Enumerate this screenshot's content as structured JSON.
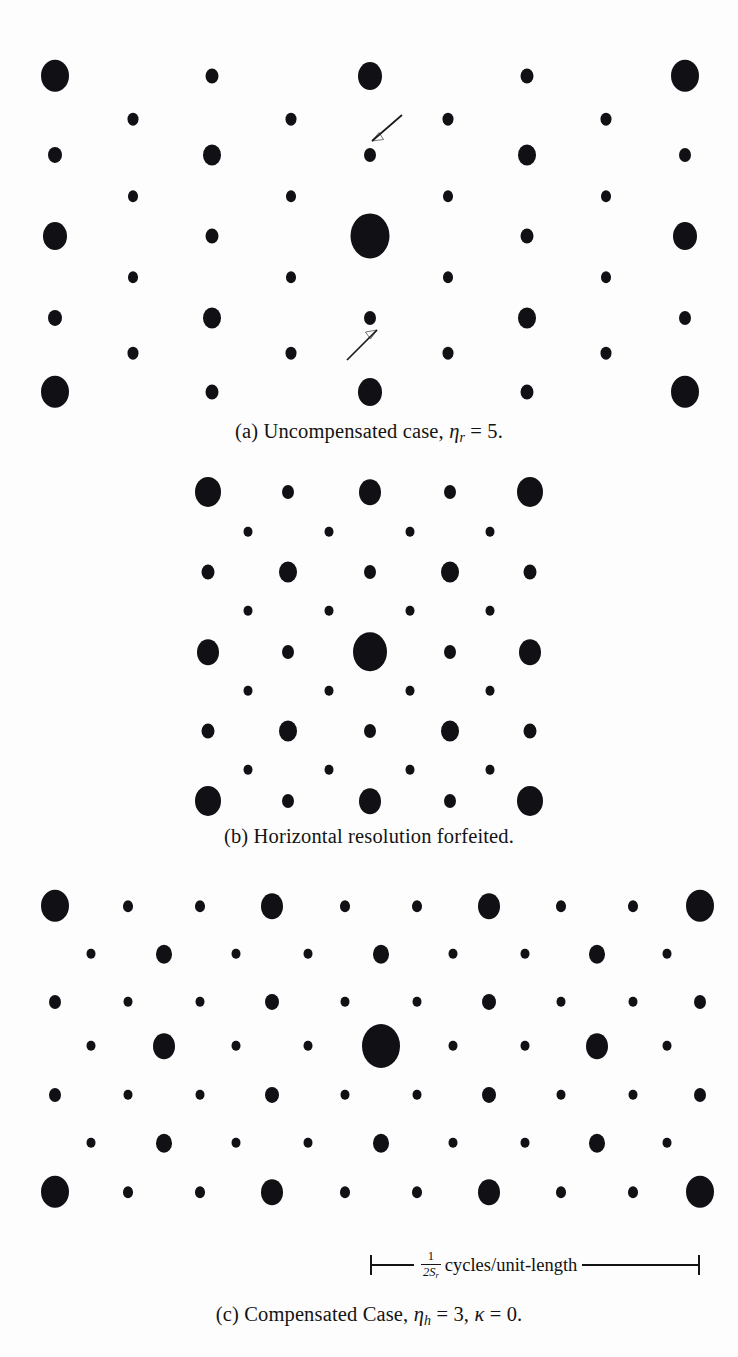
{
  "figure": {
    "type": "scanned-paper-figure",
    "background_color": "#fdfdfd",
    "ink_color": "#111015"
  },
  "panels": [
    {
      "id": "a",
      "name": "uncompensated",
      "caption_prefix": "(a)",
      "caption_text": "Uncompensated case,",
      "caption_symbol": "η",
      "caption_subscript": "r",
      "caption_equals": "= 5.",
      "caption_full": "(a) Uncompensated case, ηr = 5.",
      "annotations": [
        {
          "name": "arrow-upper",
          "direction": "down-left",
          "target_dot": "small dot right of center, row 2"
        },
        {
          "name": "arrow-lower",
          "direction": "up-right",
          "target_dot": "small dot right of center, row 6"
        }
      ],
      "lattice": {
        "columns_main": 5,
        "columns_offset": 4,
        "rows": 7,
        "col_spacing": 157.5,
        "row_spacing": 52.5,
        "dc_dot_radius": 19.5
      }
    },
    {
      "id": "b",
      "name": "horizontal-resolution-forfeited",
      "caption_prefix": "(b)",
      "caption_text": "Horizontal resolution forfeited.",
      "caption_full": "(b) Horizontal resolution forfeited.",
      "annotations": [],
      "lattice": {
        "columns_main": 5,
        "columns_offset": 4,
        "rows": 9,
        "col_spacing": 80.5,
        "row_spacing": 40,
        "dc_dot_radius": 17
      }
    },
    {
      "id": "c",
      "name": "compensated",
      "caption_prefix": "(c)",
      "caption_text": "Compensated Case,",
      "caption_symbol_1": "η",
      "caption_subscript_1": "h",
      "caption_value_1": "= 3,",
      "caption_symbol_2": "κ",
      "caption_value_2": "= 0.",
      "caption_full": "(c) Compensated Case, ηh = 3, κ = 0.",
      "annotations": [],
      "lattice": {
        "columns_main": 10,
        "columns_offset": 9,
        "rows": 7,
        "col_spacing": 71.7,
        "row_spacing": 48,
        "dc_dot_radius": 19
      }
    }
  ],
  "scalebar": {
    "name": "frequency-scale-bar",
    "numerator": "1",
    "denominator": "2S",
    "denominator_subscript": "r",
    "unit_text": "cycles/unit-length",
    "full_text": "1/2Sr cycles/unit-length"
  },
  "dots": {
    "panel_a": [
      {
        "x": 55,
        "y": 76,
        "r": 14
      },
      {
        "x": 212,
        "y": 76,
        "r": 6.5
      },
      {
        "x": 370,
        "y": 76,
        "r": 12
      },
      {
        "x": 527,
        "y": 76,
        "r": 6.5
      },
      {
        "x": 685,
        "y": 76,
        "r": 14
      },
      {
        "x": 133,
        "y": 119,
        "r": 5.5
      },
      {
        "x": 291,
        "y": 119,
        "r": 5.5
      },
      {
        "x": 448,
        "y": 119,
        "r": 5.5
      },
      {
        "x": 606,
        "y": 119,
        "r": 5.5
      },
      {
        "x": 55,
        "y": 155,
        "r": 7
      },
      {
        "x": 212,
        "y": 155,
        "r": 9
      },
      {
        "x": 370,
        "y": 155,
        "r": 6
      },
      {
        "x": 527,
        "y": 155,
        "r": 9
      },
      {
        "x": 685,
        "y": 155,
        "r": 6
      },
      {
        "x": 133,
        "y": 196,
        "r": 5
      },
      {
        "x": 291,
        "y": 196,
        "r": 5
      },
      {
        "x": 448,
        "y": 196,
        "r": 5
      },
      {
        "x": 606,
        "y": 196,
        "r": 5
      },
      {
        "x": 55,
        "y": 236,
        "r": 12
      },
      {
        "x": 212,
        "y": 236,
        "r": 6.5
      },
      {
        "x": 370,
        "y": 236,
        "r": 19.5
      },
      {
        "x": 527,
        "y": 236,
        "r": 6.5
      },
      {
        "x": 685,
        "y": 236,
        "r": 12
      },
      {
        "x": 133,
        "y": 277,
        "r": 5
      },
      {
        "x": 291,
        "y": 277,
        "r": 5
      },
      {
        "x": 448,
        "y": 277,
        "r": 5
      },
      {
        "x": 606,
        "y": 277,
        "r": 5
      },
      {
        "x": 55,
        "y": 318,
        "r": 7
      },
      {
        "x": 212,
        "y": 318,
        "r": 9
      },
      {
        "x": 370,
        "y": 318,
        "r": 6
      },
      {
        "x": 527,
        "y": 318,
        "r": 9
      },
      {
        "x": 685,
        "y": 318,
        "r": 6
      },
      {
        "x": 133,
        "y": 353,
        "r": 5.5
      },
      {
        "x": 291,
        "y": 353,
        "r": 5.5
      },
      {
        "x": 448,
        "y": 353,
        "r": 5.5
      },
      {
        "x": 606,
        "y": 353,
        "r": 5.5
      },
      {
        "x": 55,
        "y": 392,
        "r": 14
      },
      {
        "x": 212,
        "y": 392,
        "r": 6.5
      },
      {
        "x": 370,
        "y": 392,
        "r": 12
      },
      {
        "x": 527,
        "y": 392,
        "r": 6.5
      },
      {
        "x": 685,
        "y": 392,
        "r": 14
      }
    ],
    "panel_b": [
      {
        "x": 208,
        "y": 492,
        "r": 13
      },
      {
        "x": 288,
        "y": 492,
        "r": 6
      },
      {
        "x": 370,
        "y": 492,
        "r": 11
      },
      {
        "x": 450,
        "y": 492,
        "r": 6
      },
      {
        "x": 530,
        "y": 492,
        "r": 13
      },
      {
        "x": 248,
        "y": 532,
        "r": 4.5
      },
      {
        "x": 329,
        "y": 532,
        "r": 4.5
      },
      {
        "x": 410,
        "y": 532,
        "r": 4.5
      },
      {
        "x": 490,
        "y": 532,
        "r": 4.5
      },
      {
        "x": 208,
        "y": 572,
        "r": 6.5
      },
      {
        "x": 288,
        "y": 572,
        "r": 9
      },
      {
        "x": 370,
        "y": 572,
        "r": 6
      },
      {
        "x": 450,
        "y": 572,
        "r": 9
      },
      {
        "x": 530,
        "y": 572,
        "r": 6.5
      },
      {
        "x": 248,
        "y": 611,
        "r": 4.5
      },
      {
        "x": 329,
        "y": 611,
        "r": 4.5
      },
      {
        "x": 410,
        "y": 611,
        "r": 4.5
      },
      {
        "x": 490,
        "y": 611,
        "r": 4.5
      },
      {
        "x": 208,
        "y": 652,
        "r": 11
      },
      {
        "x": 288,
        "y": 652,
        "r": 6
      },
      {
        "x": 370,
        "y": 652,
        "r": 17
      },
      {
        "x": 450,
        "y": 652,
        "r": 6
      },
      {
        "x": 530,
        "y": 652,
        "r": 11
      },
      {
        "x": 248,
        "y": 691,
        "r": 4.5
      },
      {
        "x": 329,
        "y": 691,
        "r": 4.5
      },
      {
        "x": 410,
        "y": 691,
        "r": 4.5
      },
      {
        "x": 490,
        "y": 691,
        "r": 4.5
      },
      {
        "x": 208,
        "y": 731,
        "r": 6.5
      },
      {
        "x": 288,
        "y": 731,
        "r": 9
      },
      {
        "x": 370,
        "y": 731,
        "r": 6
      },
      {
        "x": 450,
        "y": 731,
        "r": 9
      },
      {
        "x": 530,
        "y": 731,
        "r": 6.5
      },
      {
        "x": 248,
        "y": 770,
        "r": 4.5
      },
      {
        "x": 329,
        "y": 770,
        "r": 4.5
      },
      {
        "x": 410,
        "y": 770,
        "r": 4.5
      },
      {
        "x": 490,
        "y": 770,
        "r": 4.5
      },
      {
        "x": 208,
        "y": 801,
        "r": 13
      },
      {
        "x": 288,
        "y": 801,
        "r": 6
      },
      {
        "x": 370,
        "y": 801,
        "r": 11
      },
      {
        "x": 450,
        "y": 801,
        "r": 6
      },
      {
        "x": 530,
        "y": 801,
        "r": 13
      }
    ],
    "panel_c": [
      {
        "x": 55,
        "y": 906,
        "r": 14
      },
      {
        "x": 128,
        "y": 906,
        "r": 5
      },
      {
        "x": 200,
        "y": 906,
        "r": 5
      },
      {
        "x": 272,
        "y": 906,
        "r": 11
      },
      {
        "x": 345,
        "y": 906,
        "r": 5
      },
      {
        "x": 417,
        "y": 906,
        "r": 5
      },
      {
        "x": 489,
        "y": 906,
        "r": 11
      },
      {
        "x": 561,
        "y": 906,
        "r": 5
      },
      {
        "x": 633,
        "y": 906,
        "r": 5
      },
      {
        "x": 700,
        "y": 906,
        "r": 14
      },
      {
        "x": 91,
        "y": 954,
        "r": 4.5
      },
      {
        "x": 164,
        "y": 954,
        "r": 8
      },
      {
        "x": 236,
        "y": 954,
        "r": 4.5
      },
      {
        "x": 308,
        "y": 954,
        "r": 4.5
      },
      {
        "x": 381,
        "y": 954,
        "r": 8
      },
      {
        "x": 453,
        "y": 954,
        "r": 4.5
      },
      {
        "x": 525,
        "y": 954,
        "r": 4.5
      },
      {
        "x": 597,
        "y": 954,
        "r": 8
      },
      {
        "x": 667,
        "y": 954,
        "r": 4.5
      },
      {
        "x": 55,
        "y": 1002,
        "r": 6
      },
      {
        "x": 128,
        "y": 1002,
        "r": 4.5
      },
      {
        "x": 200,
        "y": 1002,
        "r": 4.5
      },
      {
        "x": 272,
        "y": 1002,
        "r": 7
      },
      {
        "x": 345,
        "y": 1002,
        "r": 4.5
      },
      {
        "x": 417,
        "y": 1002,
        "r": 4.5
      },
      {
        "x": 489,
        "y": 1002,
        "r": 7
      },
      {
        "x": 561,
        "y": 1002,
        "r": 4.5
      },
      {
        "x": 633,
        "y": 1002,
        "r": 4.5
      },
      {
        "x": 700,
        "y": 1002,
        "r": 6
      },
      {
        "x": 91,
        "y": 1046,
        "r": 4.5
      },
      {
        "x": 164,
        "y": 1046,
        "r": 11
      },
      {
        "x": 236,
        "y": 1046,
        "r": 4.5
      },
      {
        "x": 308,
        "y": 1046,
        "r": 4.5
      },
      {
        "x": 381,
        "y": 1046,
        "r": 19
      },
      {
        "x": 453,
        "y": 1046,
        "r": 4.5
      },
      {
        "x": 525,
        "y": 1046,
        "r": 4.5
      },
      {
        "x": 597,
        "y": 1046,
        "r": 11
      },
      {
        "x": 667,
        "y": 1046,
        "r": 4.5
      },
      {
        "x": 55,
        "y": 1095,
        "r": 6
      },
      {
        "x": 128,
        "y": 1095,
        "r": 4.5
      },
      {
        "x": 200,
        "y": 1095,
        "r": 4.5
      },
      {
        "x": 272,
        "y": 1095,
        "r": 7
      },
      {
        "x": 345,
        "y": 1095,
        "r": 4.5
      },
      {
        "x": 417,
        "y": 1095,
        "r": 4.5
      },
      {
        "x": 489,
        "y": 1095,
        "r": 7
      },
      {
        "x": 561,
        "y": 1095,
        "r": 4.5
      },
      {
        "x": 633,
        "y": 1095,
        "r": 4.5
      },
      {
        "x": 700,
        "y": 1095,
        "r": 6
      },
      {
        "x": 91,
        "y": 1143,
        "r": 4.5
      },
      {
        "x": 164,
        "y": 1143,
        "r": 8
      },
      {
        "x": 236,
        "y": 1143,
        "r": 4.5
      },
      {
        "x": 308,
        "y": 1143,
        "r": 4.5
      },
      {
        "x": 381,
        "y": 1143,
        "r": 8
      },
      {
        "x": 453,
        "y": 1143,
        "r": 4.5
      },
      {
        "x": 525,
        "y": 1143,
        "r": 4.5
      },
      {
        "x": 597,
        "y": 1143,
        "r": 8
      },
      {
        "x": 667,
        "y": 1143,
        "r": 4.5
      },
      {
        "x": 55,
        "y": 1192,
        "r": 14
      },
      {
        "x": 128,
        "y": 1192,
        "r": 5
      },
      {
        "x": 200,
        "y": 1192,
        "r": 5
      },
      {
        "x": 272,
        "y": 1192,
        "r": 11
      },
      {
        "x": 345,
        "y": 1192,
        "r": 5
      },
      {
        "x": 417,
        "y": 1192,
        "r": 5
      },
      {
        "x": 489,
        "y": 1192,
        "r": 11
      },
      {
        "x": 561,
        "y": 1192,
        "r": 5
      },
      {
        "x": 633,
        "y": 1192,
        "r": 5
      },
      {
        "x": 700,
        "y": 1192,
        "r": 14
      }
    ]
  }
}
